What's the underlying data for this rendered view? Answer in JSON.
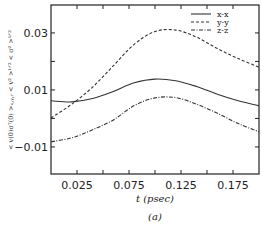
{
  "chart_data": {
    "type": "line",
    "title": "",
    "caption": "(a)",
    "xlabel": "t (psec)",
    "ylabel": "< v(0)σᵀ(0) >ₓ,ᵧ,ᵣ < v² >¹ᐟ² < σ² >¹ᐟ²",
    "xlim": [
      0.0,
      0.2
    ],
    "ylim": [
      -0.0195,
      0.0398
    ],
    "xticks": [
      0.025,
      0.075,
      0.125,
      0.175
    ],
    "xtick_labels": [
      "0.025",
      "0.075",
      "0.125",
      "0.175"
    ],
    "xminor_ticks": [
      0.05,
      0.1,
      0.15
    ],
    "yticks": [
      0.03,
      0.01,
      -0.01
    ],
    "ytick_labels": [
      "0.03",
      "0.01",
      "−0.01"
    ],
    "yminor_ticks": [
      0.02,
      0.0
    ],
    "grid": false,
    "legend_position": "upper right",
    "x": [
      0.0,
      0.02,
      0.04,
      0.06,
      0.08,
      0.1,
      0.12,
      0.14,
      0.16,
      0.18,
      0.2
    ],
    "series": [
      {
        "name": "x-x",
        "style": "solid",
        "values": [
          0.0062,
          0.0058,
          0.007,
          0.0095,
          0.0125,
          0.0138,
          0.0132,
          0.0112,
          0.0085,
          0.0062,
          0.0044
        ]
      },
      {
        "name": "y-y",
        "style": "dashed",
        "values": [
          0.0002,
          0.005,
          0.011,
          0.0185,
          0.026,
          0.0305,
          0.031,
          0.0285,
          0.0245,
          0.021,
          0.018
        ]
      },
      {
        "name": "z-z",
        "style": "dash-dot",
        "values": [
          -0.0082,
          -0.0068,
          -0.004,
          -0.0005,
          0.0045,
          0.0072,
          0.0073,
          0.005,
          0.0018,
          -0.0018,
          -0.0047
        ]
      }
    ]
  }
}
